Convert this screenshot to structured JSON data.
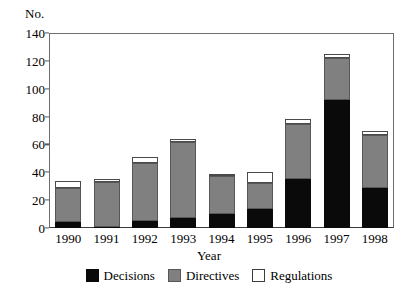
{
  "chart_data": {
    "type": "bar",
    "subtype": "stacked-vertical",
    "title": "",
    "xlabel": "Year",
    "ylabel": "No.",
    "ylim": [
      0,
      140
    ],
    "yticks": [
      0,
      20,
      40,
      60,
      80,
      100,
      120,
      140
    ],
    "grid": false,
    "legend_position": "bottom-center",
    "categories": [
      "1990",
      "1991",
      "1992",
      "1993",
      "1994",
      "1995",
      "1996",
      "1997",
      "1998"
    ],
    "series": [
      {
        "name": "Decisions",
        "color": "#0a0a0a",
        "values": [
          4,
          1,
          5,
          7,
          10,
          14,
          35,
          92,
          29
        ]
      },
      {
        "name": "Directives",
        "color": "#808080",
        "values": [
          25,
          32,
          42,
          55,
          27,
          18,
          40,
          30,
          38
        ]
      },
      {
        "name": "Regulations",
        "color": "#ffffff",
        "values": [
          5,
          2,
          4,
          2,
          1,
          8,
          3,
          3,
          3
        ]
      }
    ],
    "totals": [
      34,
      35,
      51,
      64,
      38,
      40,
      78,
      125,
      70
    ]
  },
  "axis": {
    "y_unit_caption": "No.",
    "x_title": "Year"
  },
  "legend": {
    "items": [
      {
        "label": "Decisions",
        "swatch": "black-square-swatch"
      },
      {
        "label": "Directives",
        "swatch": "gray-square-swatch"
      },
      {
        "label": "Regulations",
        "swatch": "white-square-swatch"
      }
    ]
  }
}
